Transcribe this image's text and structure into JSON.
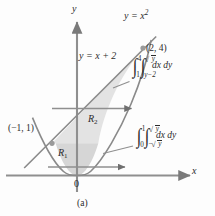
{
  "figure": {
    "caption": "(a)",
    "axes": {
      "y_label": "y",
      "x_label": "x",
      "origin_label": "0"
    },
    "curves": [
      {
        "name": "parabola",
        "label": "y = x",
        "exponent": "2",
        "equation": "y = x^2",
        "color": "#8a8a8a"
      },
      {
        "name": "line",
        "label": "y = x + 2",
        "equation": "y = x + 2",
        "color": "#8a8a8a"
      }
    ],
    "points": [
      {
        "name": "intersection-upper",
        "label": "(2, 4)",
        "x": 2,
        "y": 4
      },
      {
        "name": "intersection-lower",
        "label": "(−1, 1)",
        "x": -1,
        "y": 1
      }
    ],
    "regions": [
      {
        "name": "R1",
        "label": "R",
        "subscript": "1",
        "fill": "#d6d6d6",
        "description": "region below y = 1 bounded by the parabola"
      },
      {
        "name": "R2",
        "label": "R",
        "subscript": "2",
        "fill": "#e3e3e3",
        "description": "region between y = 1 and y = 4 bounded by line and parabola"
      }
    ],
    "integrals": [
      {
        "name": "upper-integral",
        "outer_lower": "1",
        "outer_upper": "4",
        "inner_lower": "y−2",
        "inner_upper": "√y",
        "inner_upper_radicand": "y",
        "differentials": "dx dy",
        "plain": "∫₁⁴ ∫(y−2)^(√y) dx dy"
      },
      {
        "name": "lower-integral",
        "outer_lower": "0",
        "outer_upper": "1",
        "inner_lower": "−√y",
        "inner_upper": "√y",
        "inner_lower_radicand": "y",
        "inner_upper_radicand": "y",
        "differentials": "dx dy",
        "plain": "∫₀¹ ∫(−√y)^(√y) dx dy"
      }
    ],
    "colors": {
      "axis": "#7a7a7a",
      "curve": "#8a8a8a",
      "region_light": "#e3e3e3",
      "region_dark": "#d6d6d6",
      "text": "#2b2b2b",
      "background": "#fdfdfd"
    }
  }
}
